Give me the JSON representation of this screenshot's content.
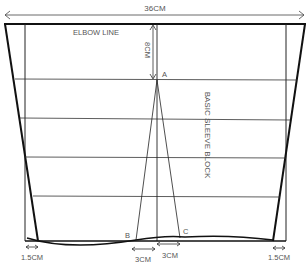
{
  "diagram": {
    "title": "BASIC SLEEVE BLOCK",
    "width_label": "36CM",
    "elbow_label": "ELBOW LINE",
    "depth_label": "8CM",
    "points": {
      "a": "A",
      "b": "B",
      "c": "C"
    },
    "bottom_labels": {
      "left_offset": "1.5CM",
      "right_offset": "1.5CM",
      "dart_left": "3CM",
      "dart_right": "3CM"
    },
    "colors": {
      "line": "#1a1a1a",
      "text": "#555555",
      "background": "#ffffff"
    }
  }
}
